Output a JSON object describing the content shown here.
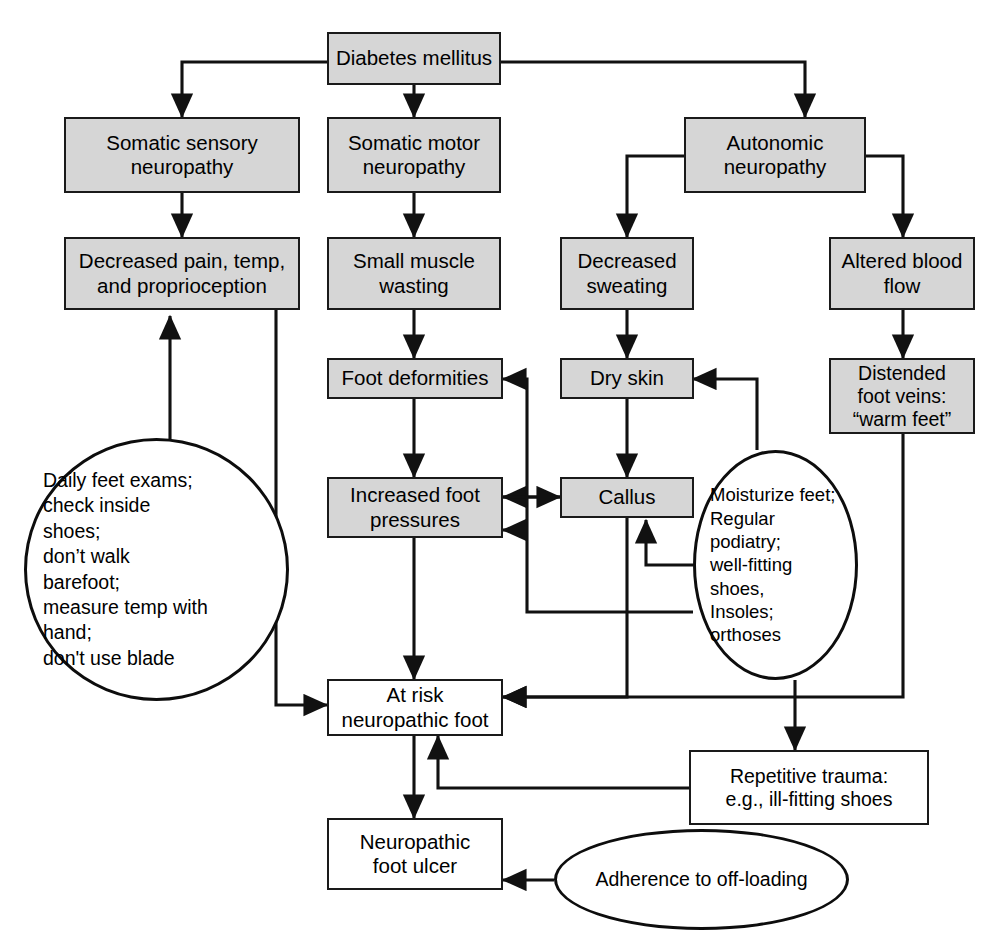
{
  "diagram": {
    "colors": {
      "box_fill": "#d6d6d6",
      "plain_fill": "#ffffff",
      "stroke": "#1a1a1a",
      "background": "#ffffff"
    },
    "nodes": [
      {
        "id": "diabetes",
        "label": "Diabetes mellitus"
      },
      {
        "id": "somatic_sensory",
        "label": "Somatic sensory\nneuropathy"
      },
      {
        "id": "somatic_motor",
        "label": "Somatic motor\nneuropathy"
      },
      {
        "id": "autonomic",
        "label": "Autonomic\nneuropathy"
      },
      {
        "id": "decreased_pain",
        "label": "Decreased pain, temp,\nand proprioception"
      },
      {
        "id": "small_muscle",
        "label": "Small muscle\nwasting"
      },
      {
        "id": "decreased_sweat",
        "label": "Decreased\nsweating"
      },
      {
        "id": "altered_blood",
        "label": "Altered blood\nflow"
      },
      {
        "id": "foot_deform",
        "label": "Foot deformities"
      },
      {
        "id": "dry_skin",
        "label": "Dry skin"
      },
      {
        "id": "distended",
        "label": "Distended\nfoot veins:\n“warm feet”"
      },
      {
        "id": "increased_press",
        "label": "Increased foot\npressures"
      },
      {
        "id": "callus",
        "label": "Callus"
      },
      {
        "id": "at_risk",
        "label": "At risk\nneuropathic foot"
      },
      {
        "id": "repetitive",
        "label": "Repetitive  trauma:\ne.g., ill-fitting shoes"
      },
      {
        "id": "ulcer",
        "label": "Neuropathic\nfoot ulcer"
      }
    ],
    "ellipses": [
      {
        "id": "self_care",
        "label": "Daily feet exams;\ncheck inside\n   shoes;\ndon’t walk\n   barefoot;\nmeasure temp with\n   hand;\ndon't use blade"
      },
      {
        "id": "foot_care",
        "label": "Moisturize feet;\nRegular\n   podiatry;\nwell-fitting\n   shoes,\nInsoles;\n   orthoses"
      },
      {
        "id": "adherence",
        "label": "Adherence to off-loading"
      }
    ]
  }
}
